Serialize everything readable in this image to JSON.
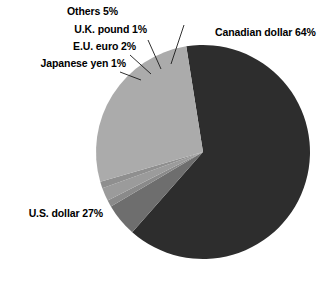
{
  "chart_data": {
    "type": "pie",
    "title": "",
    "subtitle": "",
    "xlabel": "",
    "ylabel": "",
    "legend_position": "none",
    "grid": false,
    "unit": "%",
    "categories": [
      "Canadian dollar",
      "Others",
      "U.K. pound",
      "E.U. euro",
      "Japanese yen",
      "U.S. dollar"
    ],
    "values": [
      64,
      5,
      1,
      2,
      1,
      27
    ],
    "slices": [
      {
        "name": "Canadian dollar",
        "value": 64,
        "label": "Canadian dollar 64%",
        "color": "#2d2d2d"
      },
      {
        "name": "Others",
        "value": 5,
        "label": "Others 5%",
        "color": "#6e6e6e"
      },
      {
        "name": "U.K. pound",
        "value": 1,
        "label": "U.K. pound 1%",
        "color": "#8a8a8a"
      },
      {
        "name": "E.U. euro",
        "value": 2,
        "label": "E.U. euro 2%",
        "color": "#9b9b9b"
      },
      {
        "name": "Japanese yen",
        "value": 1,
        "label": "Japanese yen 1%",
        "color": "#8f8f8f"
      },
      {
        "name": "U.S. dollar",
        "value": 27,
        "label": "U.S. dollar 27%",
        "color": "#ababab"
      }
    ],
    "background_color": "#ffffff",
    "label_color": "#000000",
    "leader_line_color": "#1a1a1a"
  }
}
